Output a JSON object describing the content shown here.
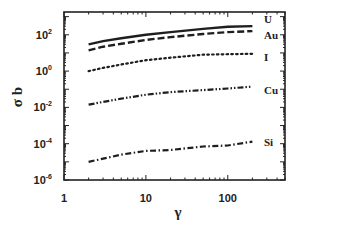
{
  "chart_data": {
    "type": "line",
    "title": "",
    "xlabel": "γ",
    "ylabel": "σ b",
    "xscale": "log",
    "yscale": "log",
    "xlim": [
      1,
      500
    ],
    "ylim": [
      1e-06,
      1800
    ],
    "grid": false,
    "legend_position": "inline-right",
    "x_ticks": [
      {
        "value": 1,
        "label": "1"
      },
      {
        "value": 10,
        "label": "10"
      },
      {
        "value": 100,
        "label": "100"
      }
    ],
    "y_ticks": [
      {
        "value": 100,
        "base": "10",
        "exp": "2"
      },
      {
        "value": 1,
        "base": "10",
        "exp": "0"
      },
      {
        "value": 0.01,
        "base": "10",
        "exp": "-2"
      },
      {
        "value": 0.0001,
        "base": "10",
        "exp": "-4"
      },
      {
        "value": 1e-06,
        "base": "10",
        "exp": "-6"
      }
    ],
    "x": [
      2,
      3,
      5,
      10,
      20,
      50,
      100,
      200
    ],
    "series": [
      {
        "name": "U",
        "style": "solid",
        "values": [
          30,
          45,
          65,
          100,
          140,
          210,
          280,
          300
        ]
      },
      {
        "name": "Au",
        "style": "dashed",
        "values": [
          14,
          22,
          32,
          52,
          75,
          110,
          140,
          160
        ]
      },
      {
        "name": "I",
        "style": "dotted",
        "values": [
          1.0,
          1.5,
          2.3,
          4,
          5.5,
          8,
          8.5,
          9
        ]
      },
      {
        "name": "Cu",
        "style": "dash-dot-dot",
        "values": [
          0.014,
          0.02,
          0.03,
          0.05,
          0.07,
          0.09,
          0.11,
          0.14
        ]
      },
      {
        "name": "Si",
        "style": "dash-dot",
        "values": [
          1e-05,
          1.5e-05,
          2.5e-05,
          4e-05,
          4.5e-05,
          7e-05,
          8e-05,
          0.00013
        ]
      }
    ]
  },
  "labels": {
    "xlabel": "γ",
    "ylabel": "σ b"
  }
}
